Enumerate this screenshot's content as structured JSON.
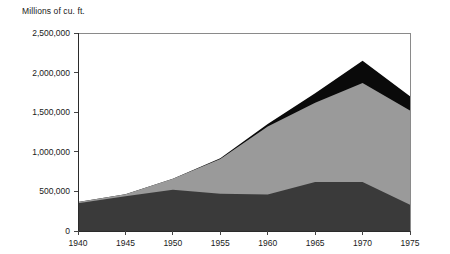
{
  "chart_data": {
    "type": "area",
    "title": "Millions of cu. ft.",
    "xlabel": "",
    "ylabel": "Millions of cu. ft.",
    "stacked": true,
    "grid": false,
    "legend_position": "none",
    "x": [
      1940,
      1945,
      1950,
      1955,
      1960,
      1965,
      1970,
      1975
    ],
    "xlim": [
      1940,
      1975
    ],
    "ylim": [
      0,
      2500000
    ],
    "xticks": [
      1940,
      1945,
      1950,
      1955,
      1960,
      1965,
      1970,
      1975
    ],
    "xtick_labels": [
      "1940",
      "1945",
      "1950",
      "1955",
      "1960",
      "1965",
      "1970",
      "1975"
    ],
    "yticks": [
      0,
      500000,
      1000000,
      1500000,
      2000000,
      2500000
    ],
    "ytick_labels": [
      "0",
      "500,000",
      "1,000,000",
      "1,500,000",
      "2,000,000",
      "2,500,000"
    ],
    "series": [
      {
        "name": "dark-band",
        "color": "#3a3a3a",
        "values": [
          350000,
          440000,
          520000,
          470000,
          460000,
          620000,
          620000,
          330000
        ]
      },
      {
        "name": "gray-band",
        "color": "#9a9a9a",
        "values": [
          15000,
          25000,
          140000,
          440000,
          860000,
          1000000,
          1250000,
          1190000
        ]
      },
      {
        "name": "black-band",
        "color": "#0a0a0a",
        "values": [
          0,
          0,
          0,
          10000,
          30000,
          120000,
          280000,
          180000
        ]
      }
    ],
    "cumulative_tops": {
      "dark": [
        350000,
        440000,
        520000,
        470000,
        460000,
        620000,
        620000,
        330000
      ],
      "gray": [
        365000,
        465000,
        660000,
        910000,
        1320000,
        1620000,
        1870000,
        1520000
      ],
      "black": [
        365000,
        465000,
        660000,
        920000,
        1350000,
        1740000,
        2150000,
        1700000
      ]
    }
  },
  "colors": {
    "dark_band": "#3a3a3a",
    "gray_band": "#9a9a9a",
    "black_band": "#0a0a0a",
    "frame": "#8a8a8a",
    "axis": "#2b2b2b",
    "text": "#1a1a1a",
    "background": "#ffffff"
  }
}
